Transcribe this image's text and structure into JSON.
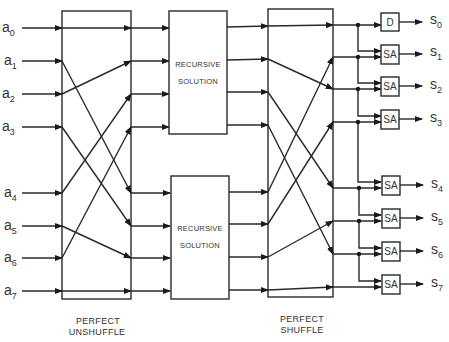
{
  "diagram": {
    "title": "",
    "inputs": [
      {
        "base": "a",
        "sub": "0",
        "y": 28
      },
      {
        "base": "a",
        "sub": "1",
        "y": 61
      },
      {
        "base": "a",
        "sub": "2",
        "y": 94
      },
      {
        "base": "a",
        "sub": "3",
        "y": 127
      },
      {
        "base": "a",
        "sub": "4",
        "y": 193
      },
      {
        "base": "a",
        "sub": "5",
        "y": 226
      },
      {
        "base": "a",
        "sub": "6",
        "y": 258
      },
      {
        "base": "a",
        "sub": "7",
        "y": 291
      }
    ],
    "outputs": [
      {
        "base": "s",
        "sub": "0",
        "gate": "D"
      },
      {
        "base": "s",
        "sub": "1",
        "gate": "SA"
      },
      {
        "base": "s",
        "sub": "2",
        "gate": "SA"
      },
      {
        "base": "s",
        "sub": "3",
        "gate": "SA"
      },
      {
        "base": "s",
        "sub": "4",
        "gate": "SA"
      },
      {
        "base": "s",
        "sub": "5",
        "gate": "SA"
      },
      {
        "base": "s",
        "sub": "6",
        "gate": "SA"
      },
      {
        "base": "s",
        "sub": "7",
        "gate": "SA"
      }
    ],
    "unshuffle": {
      "caption_line1": "PERFECT",
      "caption_line2": "UNSHUFFLE",
      "mapping": [
        0,
        4,
        1,
        5,
        2,
        6,
        3,
        7
      ]
    },
    "recursive_top": {
      "line1": "RECURSIVE",
      "line2": "SOLUTION"
    },
    "recursive_bottom": {
      "line1": "RECURSIVE",
      "line2": "SOLUTION"
    },
    "shuffle": {
      "caption_line1": "PERFECT",
      "caption_line2": "SHUFFLE",
      "mapping": [
        0,
        2,
        4,
        6,
        1,
        3,
        5,
        7
      ]
    },
    "colors": {
      "line": "#2a2a2a",
      "text": "#333333",
      "background": "#ffffff"
    }
  }
}
